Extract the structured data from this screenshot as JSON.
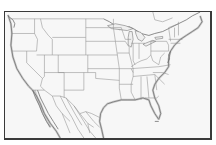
{
  "map": {
    "type": "outline-map",
    "region": "United States (contiguous) with portions of Canada and Mexico",
    "labels": [],
    "colors": {
      "background": "#ffffff",
      "land": "#f7f7f7",
      "borders": "#8a8a8a",
      "frame": "#3a3a3a",
      "coast_shade": "#b8b8b8"
    }
  }
}
